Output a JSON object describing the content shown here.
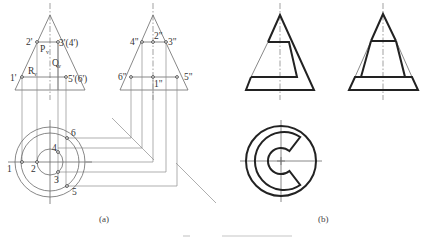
{
  "figure": {
    "subfigures": [
      {
        "id": "a",
        "caption": "(a)",
        "views": [
          "front",
          "side",
          "top"
        ],
        "front_labels": {
          "p1": "1'",
          "p2": "2'",
          "p34": "3'(4')",
          "p56": "5'(6')",
          "P": "P",
          "P_sub": "v",
          "Q": "Q",
          "Q_sub": "v",
          "R": "R",
          "R_sub": "v"
        },
        "side_labels": {
          "p1": "1\"",
          "p2": "2\"",
          "p3": "3\"",
          "p4": "4\"",
          "p5": "5\"",
          "p6": "6\""
        },
        "top_labels": {
          "p1": "1",
          "p2": "2",
          "p3": "3",
          "p4": "4",
          "p5": "5",
          "p6": "6"
        }
      },
      {
        "id": "b",
        "caption": "(b)",
        "views": [
          "front",
          "side",
          "top"
        ]
      }
    ],
    "colors": {
      "thick_line": "#222222",
      "thin_line": "#6a6a6a",
      "projection_line": "#8c8c8c",
      "background": "#ffffff"
    }
  }
}
